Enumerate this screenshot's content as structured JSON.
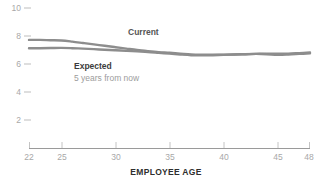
{
  "chart_data": {
    "type": "line",
    "title": "",
    "xlabel": "EMPLOYEE AGE",
    "ylabel": "",
    "xlim": [
      22,
      48
    ],
    "ylim": [
      0,
      10.8
    ],
    "grid": false,
    "legend_position": "inline-annotation",
    "x_ticks": [
      22,
      25,
      30,
      35,
      40,
      45,
      48
    ],
    "x_tick_labels": [
      "22",
      "25",
      "30",
      "35",
      "40",
      "45",
      "48"
    ],
    "y_ticks": [
      2,
      4,
      6,
      8,
      10
    ],
    "y_tick_labels": [
      "2",
      "4",
      "6",
      "8",
      "10"
    ],
    "x": [
      22,
      23,
      24,
      25,
      26,
      27,
      28,
      29,
      30,
      31,
      32,
      33,
      34,
      35,
      36,
      37,
      38,
      39,
      40,
      41,
      42,
      43,
      44,
      45,
      46,
      47,
      48
    ],
    "series": [
      {
        "name": "Current",
        "color": "#8d8d8d",
        "values": [
          7.72,
          7.72,
          7.7,
          7.68,
          7.6,
          7.5,
          7.4,
          7.3,
          7.2,
          7.1,
          7.0,
          6.92,
          6.85,
          6.8,
          6.74,
          6.68,
          6.66,
          6.66,
          6.67,
          6.68,
          6.7,
          6.72,
          6.74,
          6.73,
          6.74,
          6.78,
          6.82
        ]
      },
      {
        "name": "Expected",
        "color": "#8d8d8d",
        "values": [
          7.12,
          7.13,
          7.14,
          7.15,
          7.13,
          7.1,
          7.06,
          7.02,
          6.98,
          6.94,
          6.9,
          6.86,
          6.8,
          6.74,
          6.68,
          6.63,
          6.62,
          6.63,
          6.65,
          6.68,
          6.7,
          6.72,
          6.7,
          6.66,
          6.68,
          6.72,
          6.76
        ]
      }
    ],
    "annotations": [
      {
        "text": "Current",
        "x_px": 128,
        "y_px": 32
      },
      {
        "text": "Expected",
        "x_px": 74,
        "y_px": 66
      },
      {
        "text": "5 years from now",
        "x_px": 74,
        "y_px": 78
      }
    ]
  },
  "axis": {
    "x_title": "EMPLOYEE AGE"
  },
  "labels": {
    "current": "Current",
    "expected": "Expected",
    "expected_sub": "5 years from now"
  }
}
